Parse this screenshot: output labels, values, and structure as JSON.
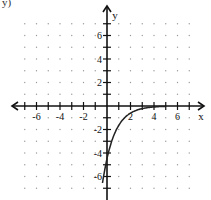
{
  "corner_fragment": "y)",
  "chart_data": {
    "type": "line",
    "title": "",
    "xlabel": "x",
    "ylabel": "y",
    "xlim": [
      -8,
      8
    ],
    "ylim": [
      -8,
      8
    ],
    "grid": "dots",
    "x_tick_labels": [
      "-6",
      "-4",
      "-2",
      "2",
      "4",
      "6"
    ],
    "y_tick_labels": [
      "6",
      "4",
      "2",
      "-2",
      "-4",
      "-6"
    ],
    "series": [
      {
        "name": "y = -e^(1.5 - x)",
        "x": [
          -0.35,
          0,
          0.5,
          1,
          1.5,
          2,
          3,
          4,
          5
        ],
        "values": [
          -7.8,
          -4.5,
          -2.7,
          -1.6,
          -1.0,
          -0.6,
          -0.2,
          -0.1,
          0.0
        ]
      }
    ],
    "colors": {
      "axis": "#111111",
      "curve": "#222222",
      "dots": "#9a9a9a"
    }
  }
}
